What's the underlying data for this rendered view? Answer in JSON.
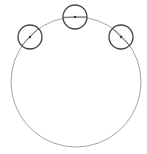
{
  "diagram": {
    "width": 147,
    "height": 154,
    "background": "#ffffff",
    "main_circle": {
      "cx": 76,
      "cy": 82,
      "r": 65,
      "segments": 36,
      "stroke": "#9a9a9a",
      "stroke_width": 0.9
    },
    "markers": [
      {
        "name": "marker-left",
        "cx": 30,
        "cy": 37,
        "r": 12,
        "stroke": "#444444"
      },
      {
        "name": "marker-top",
        "cx": 75,
        "cy": 17,
        "r": 12,
        "stroke": "#444444"
      },
      {
        "name": "marker-right",
        "cx": 121,
        "cy": 37,
        "r": 12,
        "stroke": "#444444"
      }
    ]
  }
}
